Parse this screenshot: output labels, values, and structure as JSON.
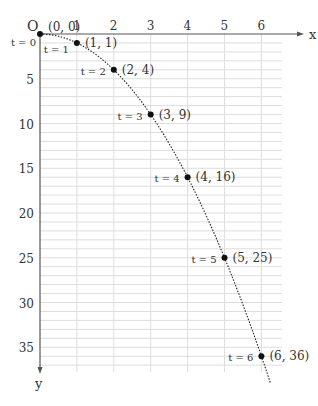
{
  "chart_data": {
    "type": "line",
    "title": "",
    "xlabel": "x",
    "ylabel": "y",
    "origin_label": "O",
    "x_ticks": [
      "1",
      "2",
      "3",
      "4",
      "5",
      "6"
    ],
    "y_ticks": [
      "5",
      "10",
      "15",
      "20",
      "25",
      "30",
      "35"
    ],
    "xlim": [
      0,
      6.5
    ],
    "ylim": [
      0,
      37
    ],
    "y_axis_inverted": true,
    "grid": true,
    "series": [
      {
        "name": "y = x^2",
        "style": "dotted"
      }
    ],
    "points": [
      {
        "t": "t = 0",
        "x": 0,
        "y": 0,
        "label": "(0, 0)"
      },
      {
        "t": "t = 1",
        "x": 1,
        "y": 1,
        "label": "(1, 1)"
      },
      {
        "t": "t = 2",
        "x": 2,
        "y": 4,
        "label": "(2, 4)"
      },
      {
        "t": "t = 3",
        "x": 3,
        "y": 9,
        "label": "(3, 9)"
      },
      {
        "t": "t = 4",
        "x": 4,
        "y": 16,
        "label": "(4, 16)"
      },
      {
        "t": "t = 5",
        "x": 5,
        "y": 25,
        "label": "(5, 25)"
      },
      {
        "t": "t = 6",
        "x": 6,
        "y": 36,
        "label": "(6, 36)"
      }
    ]
  }
}
